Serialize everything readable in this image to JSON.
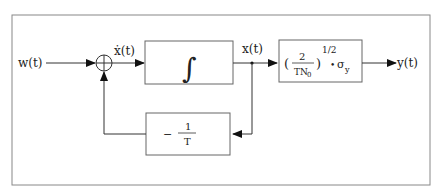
{
  "diagram": {
    "type": "block-diagram",
    "input_label": "w(t)",
    "derivative_label": "ẋ(t)",
    "state_label": "x(t)",
    "output_label": "y(t)",
    "summing_junction_symbol": "+",
    "integrator_block": {
      "symbol": "∫"
    },
    "feedback_block": {
      "sign": "−",
      "numerator": "1",
      "denominator": "T"
    },
    "gain_block": {
      "open_paren": "(",
      "numerator": "2",
      "denominator_main": "TN",
      "denominator_sub": "0",
      "close_paren": ")",
      "exponent": "1/2",
      "dot": "•",
      "sigma": "σ",
      "sigma_sub": "y"
    },
    "colors": {
      "line": "#333333",
      "frame": "#888888",
      "box": "#666666",
      "background": "#ffffff"
    }
  }
}
